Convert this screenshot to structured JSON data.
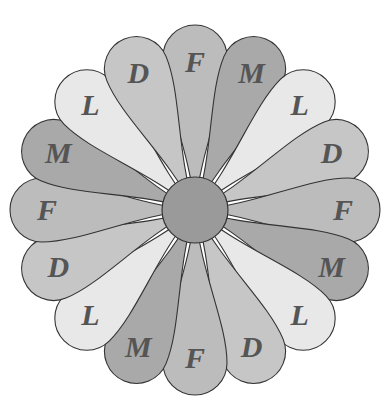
{
  "diagram": {
    "type": "flower",
    "center": {
      "x": 195,
      "y": 210,
      "radius": 33,
      "color": "#9a9a9a"
    },
    "petal_tip_radius": 185,
    "petal_width": 64,
    "label_radius": 148,
    "colors": {
      "F": "#bcbcbc",
      "M": "#a9a9a9",
      "L": "#e8e8e8",
      "D": "#c6c6c6"
    },
    "petals": [
      {
        "label": "F",
        "angle": 0
      },
      {
        "label": "M",
        "angle": 22.5
      },
      {
        "label": "L",
        "angle": 45
      },
      {
        "label": "D",
        "angle": 67.5
      },
      {
        "label": "F",
        "angle": 90
      },
      {
        "label": "M",
        "angle": 112.5
      },
      {
        "label": "L",
        "angle": 135
      },
      {
        "label": "D",
        "angle": 157.5
      },
      {
        "label": "F",
        "angle": 180
      },
      {
        "label": "M",
        "angle": 202.5
      },
      {
        "label": "L",
        "angle": 225
      },
      {
        "label": "D",
        "angle": 247.5
      },
      {
        "label": "F",
        "angle": 270
      },
      {
        "label": "M",
        "angle": 292.5
      },
      {
        "label": "L",
        "angle": 315
      },
      {
        "label": "D",
        "angle": 337.5
      }
    ]
  }
}
